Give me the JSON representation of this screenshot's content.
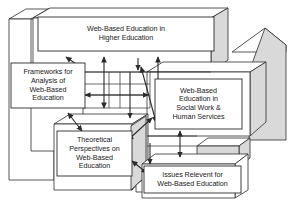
{
  "diagram": {
    "style": {
      "background_color": "#ffffff",
      "line_color": "#2b2b2b",
      "box_fill_color": "#ffffff",
      "block_face_color": "#d9d9d9",
      "block_top_color": "#ffffff",
      "text_color": "#1a1a1a"
    },
    "boxes": [
      {
        "id": "top",
        "name": "web-based-education-in-higher-education",
        "label": "Web-Based Education in\nHigher Education"
      },
      {
        "id": "frameworks",
        "name": "frameworks-for-analysis-of-web-based-education",
        "label": "Frameworks for\nAnalysis of\nWeb-Based\nEducation"
      },
      {
        "id": "social",
        "name": "web-based-education-in-social-work-and-human-services",
        "label": "Web-Based\nEducation in\nSocial Work &\nHuman Services"
      },
      {
        "id": "theoretical",
        "name": "theoretical-perspectives-on-web-based-education",
        "label": "Theoretical\nPerspectives on\nWeb-Based\nEducation"
      },
      {
        "id": "issues",
        "name": "issues-relevent-for-web-based-education",
        "label": "Issues Relevent for\nWeb-Based Education"
      }
    ],
    "connectors": [
      {
        "name": "connector-frameworks-to-top",
        "type": "double-headed-arrow"
      },
      {
        "name": "connector-frameworks-to-social",
        "type": "double-headed-arrow"
      },
      {
        "name": "connector-frameworks-to-theoretical",
        "type": "double-headed-arrow"
      },
      {
        "name": "connector-top-to-theoretical",
        "type": "double-headed-arrow"
      },
      {
        "name": "connector-top-to-social",
        "type": "double-headed-arrow"
      },
      {
        "name": "connector-top-to-issues",
        "type": "double-headed-arrow"
      },
      {
        "name": "connector-social-to-issues",
        "type": "double-headed-arrow"
      },
      {
        "name": "connector-theoretical-to-issues",
        "type": "double-headed-arrow"
      },
      {
        "name": "connector-social-to-theoretical",
        "type": "double-headed-arrow"
      }
    ]
  }
}
